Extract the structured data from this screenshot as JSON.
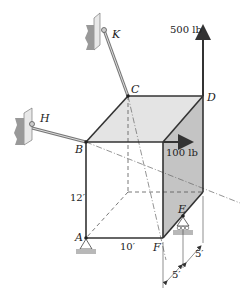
{
  "diagram": {
    "points": {
      "A": "A",
      "B": "B",
      "C": "C",
      "D": "D",
      "E": "E",
      "F": "F",
      "H": "H",
      "K": "K"
    },
    "forces": {
      "vertical": "500 lb",
      "horizontal": "100 lb"
    },
    "dimensions": {
      "height": "12′",
      "width": "10′",
      "depth1": "5′",
      "depth2": "5′"
    },
    "colors": {
      "line": "#333333",
      "top_face": "#e4e4e4",
      "side_face": "#c4c4c4",
      "wall": "#b0b0b0",
      "ground": "#b8b8b8"
    }
  }
}
